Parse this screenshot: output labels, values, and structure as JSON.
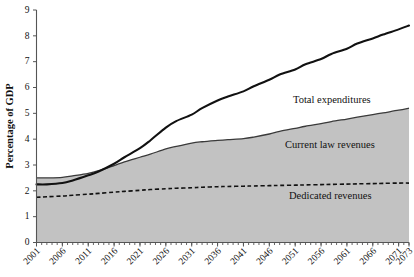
{
  "chart_data": {
    "type": "area",
    "title": "",
    "xlabel": "",
    "ylabel": "Percentage of GDP",
    "xlim": [
      2001,
      2073
    ],
    "ylim": [
      0,
      9
    ],
    "ytick_labels": [
      "0",
      "1",
      "2",
      "3",
      "4",
      "5",
      "6",
      "7",
      "8",
      "9"
    ],
    "ytick_values": [
      0,
      1,
      2,
      3,
      4,
      5,
      6,
      7,
      8,
      9
    ],
    "xtick_labels": [
      "2001",
      "2006",
      "2011",
      "2016",
      "2021",
      "2026",
      "2031",
      "2036",
      "2041",
      "2046",
      "2051",
      "2056",
      "2061",
      "2066",
      "2071",
      "2073"
    ],
    "xtick_values": [
      2001,
      2006,
      2011,
      2016,
      2021,
      2026,
      2031,
      2036,
      2041,
      2046,
      2051,
      2056,
      2061,
      2066,
      2071,
      2073
    ],
    "grid": false,
    "legend_position": "inline-annotations",
    "x": [
      2001,
      2003,
      2006,
      2008,
      2011,
      2013,
      2016,
      2018,
      2021,
      2023,
      2026,
      2028,
      2031,
      2033,
      2036,
      2038,
      2041,
      2043,
      2046,
      2048,
      2051,
      2053,
      2056,
      2058,
      2061,
      2063,
      2066,
      2068,
      2071,
      2073
    ],
    "series": [
      {
        "name": "Total expenditures",
        "style": "solid-thick",
        "color": "#111111",
        "values": [
          2.25,
          2.25,
          2.3,
          2.4,
          2.6,
          2.75,
          3.05,
          3.3,
          3.65,
          3.95,
          4.45,
          4.7,
          4.95,
          5.2,
          5.5,
          5.65,
          5.85,
          6.05,
          6.3,
          6.5,
          6.7,
          6.9,
          7.1,
          7.3,
          7.5,
          7.7,
          7.9,
          8.05,
          8.25,
          8.4
        ]
      },
      {
        "name": "Current law revenues",
        "style": "filled-area",
        "color": "#c2c2c2",
        "values": [
          2.5,
          2.5,
          2.52,
          2.58,
          2.68,
          2.78,
          2.98,
          3.12,
          3.3,
          3.42,
          3.62,
          3.72,
          3.85,
          3.9,
          3.95,
          3.98,
          4.02,
          4.08,
          4.2,
          4.3,
          4.42,
          4.5,
          4.6,
          4.68,
          4.78,
          4.85,
          4.95,
          5.02,
          5.12,
          5.2
        ]
      },
      {
        "name": "Dedicated revenues",
        "style": "dashed",
        "color": "#111111",
        "values": [
          1.75,
          1.77,
          1.8,
          1.83,
          1.87,
          1.9,
          1.95,
          1.98,
          2.02,
          2.05,
          2.08,
          2.1,
          2.12,
          2.14,
          2.16,
          2.17,
          2.18,
          2.19,
          2.2,
          2.21,
          2.22,
          2.23,
          2.24,
          2.25,
          2.26,
          2.27,
          2.28,
          2.29,
          2.3,
          2.3
        ]
      }
    ],
    "annotations": [
      {
        "text": "Total expenditures",
        "x_px": 293,
        "y_px": 103
      },
      {
        "text": "Current law revenues",
        "x_px": 285,
        "y_px": 148
      },
      {
        "text": "Dedicated revenues",
        "x_px": 289,
        "y_px": 199
      }
    ]
  },
  "colors": {
    "area_fill": "#c2c2c2",
    "line_dark": "#111111",
    "axis": "#555555",
    "background": "#ffffff"
  }
}
